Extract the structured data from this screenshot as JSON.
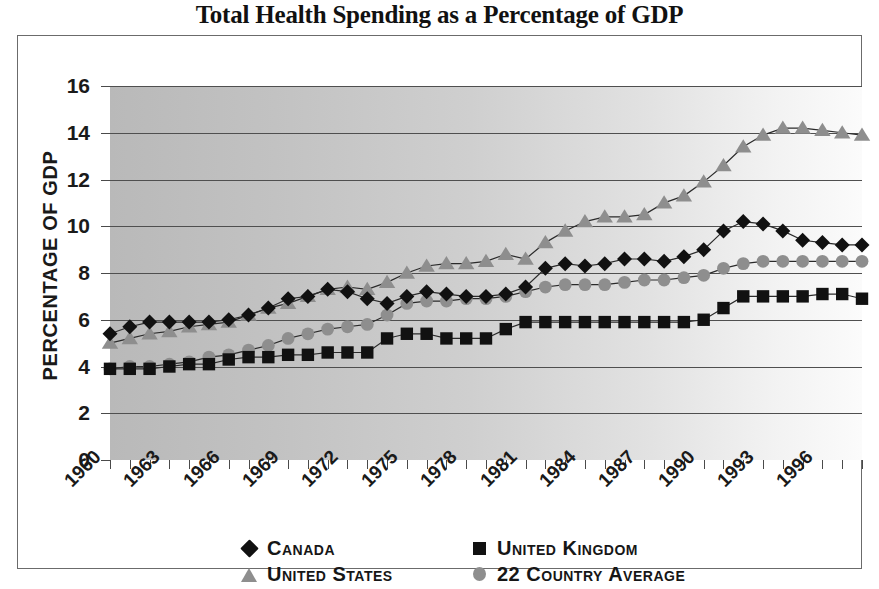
{
  "title": "Total Health Spending as a Percentage of GDP",
  "axis": {
    "y_title": "PERCENTAGE OF GDP",
    "y_ticks": [
      "16",
      "14",
      "12",
      "10",
      "8",
      "6",
      "4",
      "2",
      "0"
    ],
    "x_ticks": [
      "1960",
      "1963",
      "1966",
      "1969",
      "1972",
      "1975",
      "1978",
      "1981",
      "1984",
      "1987",
      "1990",
      "1993",
      "1996"
    ]
  },
  "legend": {
    "items": [
      {
        "label": "Canada",
        "marker": "diamond-icon",
        "color": "#111111"
      },
      {
        "label": "United Kingdom",
        "marker": "square-icon",
        "color": "#111111"
      },
      {
        "label": "United States",
        "marker": "triangle-icon",
        "color": "#8e8e8e"
      },
      {
        "label": "22 Country Average",
        "marker": "circle-icon",
        "color": "#8e8e8e"
      }
    ]
  },
  "chart_data": {
    "type": "line",
    "title": "Total Health Spending as a Percentage of GDP",
    "xlabel": "",
    "ylabel": "PERCENTAGE OF GDP",
    "ylim": [
      0,
      16
    ],
    "ytick_step": 2,
    "xlim": [
      1960,
      1998
    ],
    "xtick_step": 3,
    "grid": true,
    "legend_position": "bottom",
    "x": [
      1960,
      1961,
      1962,
      1963,
      1964,
      1965,
      1966,
      1967,
      1968,
      1969,
      1970,
      1971,
      1972,
      1973,
      1974,
      1975,
      1976,
      1977,
      1978,
      1979,
      1980,
      1981,
      1982,
      1983,
      1984,
      1985,
      1986,
      1987,
      1988,
      1989,
      1990,
      1991,
      1992,
      1993,
      1994,
      1995,
      1996,
      1997,
      1998
    ],
    "series": [
      {
        "name": "Canada",
        "marker": "diamond",
        "color": "#111111",
        "values": [
          5.4,
          5.7,
          5.9,
          5.9,
          5.9,
          5.9,
          6.0,
          6.2,
          6.5,
          6.9,
          7.0,
          7.3,
          7.2,
          6.9,
          6.7,
          7.0,
          7.2,
          7.1,
          7.0,
          7.0,
          7.1,
          7.4,
          8.2,
          8.4,
          8.3,
          8.4,
          8.6,
          8.6,
          8.5,
          8.7,
          9.0,
          9.8,
          10.2,
          10.1,
          9.8,
          9.4,
          9.3,
          9.2,
          9.2
        ]
      },
      {
        "name": "United Kingdom",
        "marker": "square",
        "color": "#111111",
        "values": [
          3.9,
          3.9,
          3.9,
          4.0,
          4.1,
          4.1,
          4.3,
          4.4,
          4.4,
          4.5,
          4.5,
          4.6,
          4.6,
          4.6,
          5.2,
          5.4,
          5.4,
          5.2,
          5.2,
          5.2,
          5.6,
          5.9,
          5.9,
          5.9,
          5.9,
          5.9,
          5.9,
          5.9,
          5.9,
          5.9,
          6.0,
          6.5,
          7.0,
          7.0,
          7.0,
          7.0,
          7.1,
          7.1,
          6.9
        ]
      },
      {
        "name": "United States",
        "marker": "triangle",
        "color": "#8e8e8e",
        "values": [
          5.0,
          5.2,
          5.4,
          5.5,
          5.7,
          5.8,
          5.9,
          6.2,
          6.5,
          6.7,
          7.0,
          7.3,
          7.4,
          7.3,
          7.6,
          8.0,
          8.3,
          8.4,
          8.4,
          8.5,
          8.8,
          8.6,
          9.3,
          9.8,
          10.2,
          10.4,
          10.4,
          10.5,
          11.0,
          11.3,
          11.9,
          12.6,
          13.4,
          13.9,
          14.2,
          14.2,
          14.1,
          14.0,
          13.9
        ]
      },
      {
        "name": "22 Country Average",
        "marker": "circle",
        "color": "#8e8e8e",
        "values": [
          3.9,
          4.0,
          4.0,
          4.1,
          4.2,
          4.4,
          4.5,
          4.7,
          4.9,
          5.2,
          5.4,
          5.6,
          5.7,
          5.8,
          6.2,
          6.7,
          6.8,
          6.8,
          6.9,
          6.9,
          7.0,
          7.2,
          7.4,
          7.5,
          7.5,
          7.5,
          7.6,
          7.7,
          7.7,
          7.8,
          7.9,
          8.2,
          8.4,
          8.5,
          8.5,
          8.5,
          8.5,
          8.5,
          8.5
        ]
      }
    ]
  }
}
